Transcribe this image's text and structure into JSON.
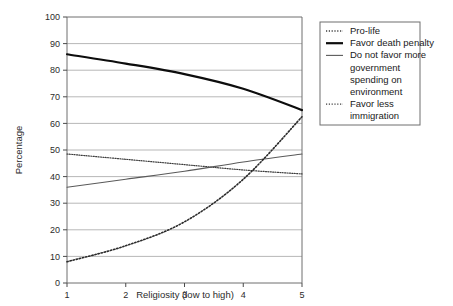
{
  "chart_data": {
    "type": "line",
    "title": "",
    "xlabel": "Religiosity (low to high)",
    "ylabel": "Percentage",
    "x": [
      1,
      2,
      3,
      4,
      5
    ],
    "xticklabels": [
      "1",
      "2",
      "3",
      "4",
      "5"
    ],
    "yticklabels": [
      "0",
      "10",
      "20",
      "30",
      "40",
      "50",
      "60",
      "70",
      "80",
      "90",
      "100"
    ],
    "ylim": [
      0,
      100
    ],
    "xlim": [
      1,
      5
    ],
    "grid": "horizontal",
    "legend_position": "right-outside",
    "series": [
      {
        "name": "Pro-life",
        "style": "dotted",
        "width": 1.2,
        "color": "#3d3d3d",
        "values": [
          48.5,
          46.5,
          44.5,
          42.5,
          41.0
        ]
      },
      {
        "name": "Favor death penalty",
        "style": "solid",
        "width": 2.2,
        "color": "#0d0d0d",
        "values": [
          86.0,
          82.5,
          78.5,
          73.0,
          65.0
        ]
      },
      {
        "name": "Do not favor more government spending on environment",
        "style": "solid",
        "width": 1.1,
        "color": "#5a5a5a",
        "values": [
          36.0,
          39.0,
          42.0,
          45.5,
          48.5
        ]
      },
      {
        "name": "Favor less immigration",
        "style": "dotted",
        "width": 1.6,
        "color": "#2a2a2a",
        "values": [
          8.0,
          14.0,
          23.0,
          39.0,
          62.5
        ]
      }
    ]
  },
  "legend": {
    "entries": [
      {
        "label": "Pro-life",
        "marker": "dotted-line-swatch"
      },
      {
        "label": "Favor death penalty",
        "marker": "thick-solid-line-swatch"
      },
      {
        "label": "Do not favor more",
        "marker": "thin-solid-line-swatch"
      },
      {
        "label": "government",
        "marker": "none"
      },
      {
        "label": "spending on",
        "marker": "none"
      },
      {
        "label": "environment",
        "marker": "none"
      },
      {
        "label": "Favor less",
        "marker": "dotted-line-swatch"
      },
      {
        "label": "immigration",
        "marker": "none"
      }
    ]
  }
}
